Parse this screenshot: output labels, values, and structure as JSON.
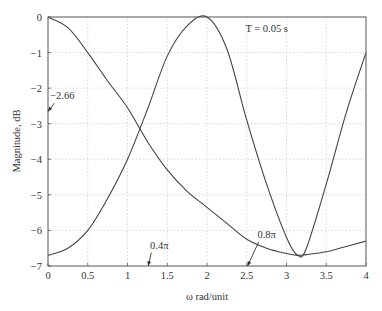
{
  "chart_data": {
    "type": "line",
    "title": "",
    "xlabel": "ω rad/unit",
    "ylabel": "Magnitude, dB",
    "xlim": [
      0,
      4
    ],
    "ylim": [
      -7,
      0
    ],
    "grid": true,
    "xticks": [
      0,
      0.5,
      1,
      1.5,
      2,
      2.5,
      3,
      3.5,
      4
    ],
    "xtick_labels": [
      "0",
      "0.5",
      "1",
      "1.5",
      "2",
      "2.5",
      "3",
      "3.5",
      "4"
    ],
    "yticks": [
      0,
      -1,
      -2,
      -3,
      -4,
      -5,
      -6,
      -7
    ],
    "ytick_labels": [
      "0",
      "−1",
      "−2",
      "−3",
      "−4",
      "−5",
      "−6",
      "−7"
    ],
    "x": [
      0,
      0.25,
      0.5,
      0.75,
      1.0,
      1.25,
      1.5,
      1.75,
      2.0,
      2.25,
      2.5,
      2.75,
      3.0,
      3.14,
      3.25,
      3.5,
      3.75,
      4.0
    ],
    "series": [
      {
        "name": "response-1 (lowpass)",
        "values": [
          0,
          -0.3,
          -1.0,
          -1.8,
          -2.55,
          -3.5,
          -4.3,
          -4.9,
          -5.35,
          -5.8,
          -6.25,
          -6.5,
          -6.65,
          -6.7,
          -6.68,
          -6.6,
          -6.45,
          -6.3
        ]
      },
      {
        "name": "response-2 (peak near ω≈2)",
        "values": [
          -6.7,
          -6.5,
          -6.0,
          -5.1,
          -4.0,
          -2.6,
          -1.1,
          -0.25,
          0,
          -0.9,
          -2.9,
          -4.7,
          -6.2,
          -6.7,
          -6.5,
          -4.7,
          -2.7,
          -1.0
        ]
      }
    ],
    "annotations": [
      {
        "text": "T = 0.05 s",
        "x": 2.75,
        "y": -0.3
      },
      {
        "text": "−2.66",
        "x": 0.18,
        "y": -2.2,
        "arrow_to": [
          0,
          -2.66
        ]
      },
      {
        "text": "0.4π",
        "x": 1.4,
        "y": -6.4,
        "arrow_to": [
          1.26,
          -7
        ]
      },
      {
        "text": "0.8π",
        "x": 2.75,
        "y": -6.1,
        "arrow_to": [
          2.51,
          -7
        ]
      }
    ]
  }
}
